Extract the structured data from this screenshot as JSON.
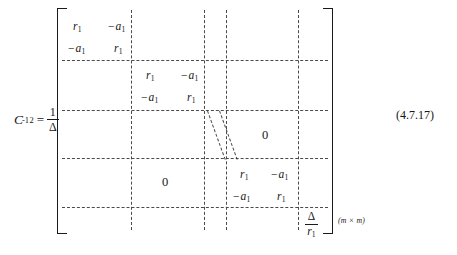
{
  "equation": {
    "label": {
      "symbol": "C",
      "subscript": "2",
      "superscript": "-1",
      "equals": "=",
      "fraction_numerator": "1",
      "fraction_denominator": "Δ"
    },
    "number": "(4.7.17)",
    "dimension": "(m × m)"
  },
  "matrix": {
    "entries": {
      "r1": "r",
      "r1_sub": "1",
      "minus_a1_minus": "−",
      "a1": "a",
      "a1_sub": "1",
      "zero": "0",
      "delta": "Δ"
    },
    "blocks": [
      {
        "name": "top-left-block",
        "rows": [
          [
            "r₁",
            "−a₁"
          ],
          [
            "−a₁",
            "r₁"
          ]
        ]
      },
      {
        "name": "second-block",
        "rows": [
          [
            "r₁",
            "−a₁"
          ],
          [
            "−a₁",
            "r₁"
          ]
        ]
      },
      {
        "name": "bottom-right-block",
        "rows": [
          [
            "r₁",
            "−a₁"
          ],
          [
            "−a₁",
            "r₁"
          ]
        ]
      }
    ],
    "zero_upper_right": "0",
    "zero_lower_left": "0",
    "last_cell": {
      "numerator": "Δ",
      "denominator": "r",
      "denominator_sub": "1"
    }
  }
}
